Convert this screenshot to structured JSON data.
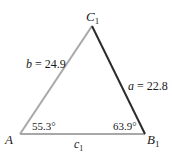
{
  "diagram": {
    "type": "triangle",
    "vertices": {
      "A": {
        "label": "A",
        "sub": ""
      },
      "B": {
        "label": "B",
        "sub": "1"
      },
      "C": {
        "label": "C",
        "sub": "1"
      }
    },
    "sides": {
      "a": {
        "name": "a",
        "eq": " = 22.8",
        "value": 22.8,
        "color": "#2b2b2b"
      },
      "b": {
        "name": "b",
        "eq": " = 24.9",
        "value": 24.9,
        "color": "#a8a8a8"
      },
      "c": {
        "name": "c",
        "sub": "1",
        "color": "#a8a8a8"
      }
    },
    "angles": {
      "A": "55.3°",
      "B": "63.9°"
    }
  }
}
